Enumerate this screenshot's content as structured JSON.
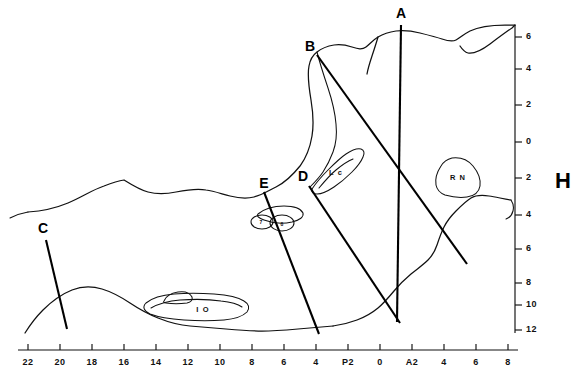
{
  "figure": {
    "panel_label": "H",
    "line_color": "#111111",
    "background_color": "#ffffff"
  },
  "axes": {
    "x_axis": {
      "orientation": "horizontal",
      "position": "bottom",
      "labels": [
        "22",
        "20",
        "18",
        "16",
        "14",
        "12",
        "10",
        "8",
        "6",
        "4",
        "P2",
        "0",
        "A2",
        "4",
        "6",
        "8"
      ],
      "tick_count": 16
    },
    "y_axis": {
      "orientation": "vertical",
      "position": "right",
      "labels": [
        "6",
        "4",
        "2",
        "0",
        "2",
        "4",
        "6",
        "8",
        "10",
        "12"
      ],
      "tick_count": 10
    }
  },
  "section_planes": [
    {
      "id": "A",
      "label": "A"
    },
    {
      "id": "B",
      "label": "B"
    },
    {
      "id": "C",
      "label": "C"
    },
    {
      "id": "D",
      "label": "D"
    },
    {
      "id": "E",
      "label": "E"
    }
  ],
  "structures": [
    {
      "id": "Lc",
      "label": "L c"
    },
    {
      "id": "RN",
      "label": "R N"
    },
    {
      "id": "IO",
      "label": "I O"
    },
    {
      "id": "s7",
      "label": "7"
    },
    {
      "id": "s8",
      "label": "8"
    }
  ]
}
